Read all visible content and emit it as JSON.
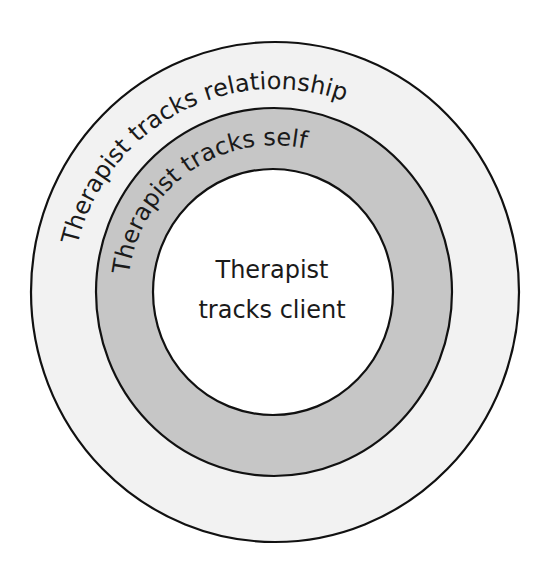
{
  "diagram": {
    "type": "concentric-circles",
    "colors": {
      "outer_ring": "#f2f2f2",
      "middle_ring": "#c6c6c6",
      "inner_circle": "#ffffff",
      "stroke": "#111111",
      "text": "#1a1a1a"
    },
    "rings": [
      {
        "id": "outer",
        "label": "Therapist tracks relationship"
      },
      {
        "id": "middle",
        "label": "Therapist tracks self"
      }
    ],
    "center": {
      "line1": "Therapist",
      "line2": "tracks client"
    }
  }
}
